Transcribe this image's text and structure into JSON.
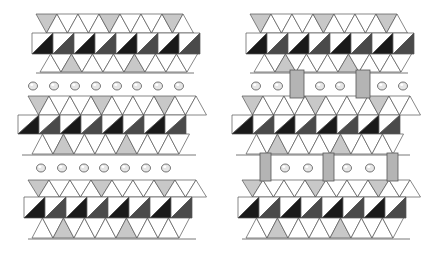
{
  "figure": {
    "colors": {
      "background": "#ffffff",
      "octa_dark": "#1a1a1a",
      "octa_mid": "#4a4a4a",
      "octa_light": "#ffffff",
      "tetra_gray": "#c8c8c8",
      "edge": "#555555",
      "pillar": "#b4b4b4",
      "ion": "#e6e6e6"
    },
    "panels": [
      {
        "id": "left",
        "x": 0,
        "pillared": false,
        "ion_rows": [
          {
            "y": 86,
            "xs": [
              33,
              54,
              75,
              96,
              117,
              137,
              158,
              179
            ]
          },
          {
            "y": 168,
            "xs": [
              41,
              62,
              84,
              104,
              125,
              146,
              166
            ]
          }
        ],
        "pillars": []
      },
      {
        "id": "right",
        "x": 214,
        "pillared": true,
        "ion_rows": [
          {
            "y": 86,
            "xs": [
              256,
              278,
              320,
              340,
              382,
              403
            ]
          },
          {
            "y": 168,
            "xs": [
              285,
              308,
              347,
              370
            ]
          }
        ],
        "pillars": [
          {
            "x": 290,
            "y": 70,
            "w": 14,
            "h": 28
          },
          {
            "x": 356,
            "y": 70,
            "w": 14,
            "h": 28
          },
          {
            "x": 260,
            "y": 153,
            "w": 11,
            "h": 28
          },
          {
            "x": 323,
            "y": 153,
            "w": 11,
            "h": 28
          },
          {
            "x": 387,
            "y": 153,
            "w": 11,
            "h": 28
          }
        ]
      }
    ],
    "layers": [
      {
        "top": 14,
        "mid": 33,
        "bot": 54,
        "bottom": 72,
        "x0": 36,
        "x1": 194,
        "offset": 0
      },
      {
        "top": 96,
        "mid": 115,
        "bot": 134,
        "bottom": 154,
        "x0": 22,
        "x1": 196,
        "offset": 6
      },
      {
        "top": 180,
        "mid": 197,
        "bot": 218,
        "bottom": 238,
        "x0": 28,
        "x1": 196,
        "offset": 0
      }
    ]
  }
}
